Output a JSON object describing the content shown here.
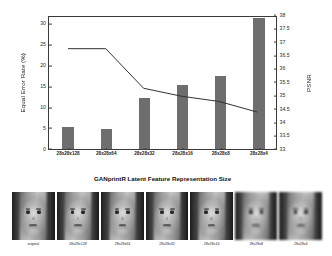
{
  "chart_data": {
    "type": "bar",
    "title": "",
    "categories": [
      "28x28x128",
      "28x28x64",
      "28x28x32",
      "28x28x16",
      "28x28x8",
      "28x28x4"
    ],
    "series": [
      {
        "name": "Equal Error Rate (%)",
        "type": "bar",
        "axis": "left",
        "values": [
          5.2,
          4.8,
          12.2,
          15.2,
          17.4,
          31.2
        ],
        "color": "#6e6e6e"
      },
      {
        "name": "PSNR",
        "type": "line",
        "axis": "right",
        "values": [
          36.8,
          36.8,
          35.3,
          35.0,
          34.8,
          34.4
        ],
        "color": "#333333"
      }
    ],
    "xlabel": "GANprintR Latent Feature Representation Size",
    "ylabel_left": "Equal Error Rate (%)",
    "ylabel_right": "PSNR",
    "ylim_left": [
      0,
      32
    ],
    "ylim_right": [
      33,
      38
    ],
    "yticks_left": [
      "0",
      "5",
      "10",
      "15",
      "20",
      "25",
      "30"
    ],
    "ytick_values_left": [
      0,
      5,
      10,
      15,
      20,
      25,
      30
    ],
    "yticks_right": [
      "33",
      "33.5",
      "34",
      "34.5",
      "35",
      "35.5",
      "36",
      "36.5",
      "37",
      "37.5",
      "38"
    ],
    "ytick_values_right": [
      33,
      33.5,
      34,
      34.5,
      35,
      35.5,
      36,
      36.5,
      37,
      37.5,
      38
    ],
    "grid": false,
    "legend": "none"
  },
  "thumbnail_strip": {
    "items": [
      {
        "caption": "original"
      },
      {
        "caption": "28x28x128"
      },
      {
        "caption": "28x28x64"
      },
      {
        "caption": "28x28x32"
      },
      {
        "caption": "28x28x16"
      },
      {
        "caption": "28x28x8"
      },
      {
        "caption": "28x28x4"
      }
    ]
  }
}
